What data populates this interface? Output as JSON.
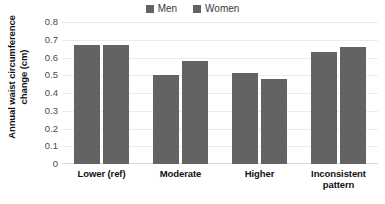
{
  "chart_data": {
    "type": "bar",
    "title": "",
    "xlabel": "",
    "ylabel": "Annual waist circumference change (cm)",
    "ylim": [
      0,
      0.8
    ],
    "ytick_labels": [
      "0.8",
      "0.7",
      "0.6",
      "0.5",
      "0.4",
      "0.3",
      "0.2",
      "0.1",
      "0"
    ],
    "ytick_values": [
      0.8,
      0.7,
      0.6,
      0.5,
      0.4,
      0.3,
      0.2,
      0.1,
      0
    ],
    "grid": true,
    "legend_position": "top-center",
    "categories": [
      "Lower (ref)",
      "Moderate",
      "Higher",
      "Inconsistent pattern"
    ],
    "series": [
      {
        "name": "Men",
        "color": "#636363",
        "values": [
          0.67,
          0.5,
          0.51,
          0.63
        ]
      },
      {
        "name": "Women",
        "color": "#636363",
        "values": [
          0.67,
          0.58,
          0.48,
          0.66
        ]
      }
    ]
  }
}
